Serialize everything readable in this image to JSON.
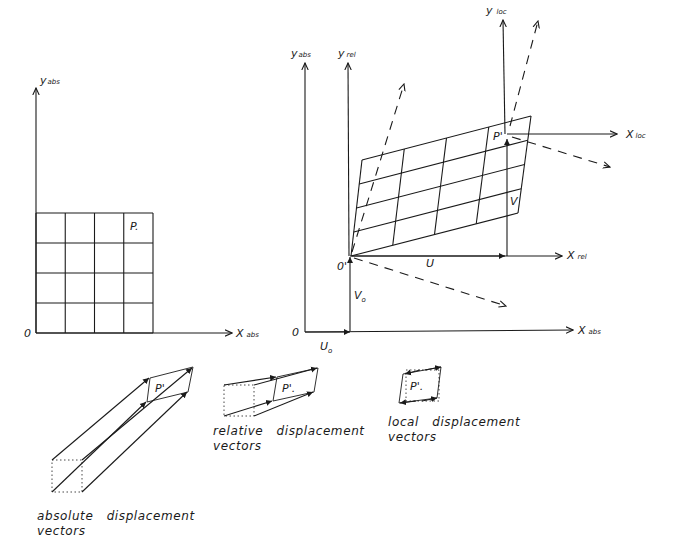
{
  "figure": {
    "left_panel": {
      "origin_label": "0",
      "x_axis_label": "X",
      "x_axis_sub": "abs",
      "y_axis_label": "y",
      "y_axis_sub": "abs",
      "point_label": "P.",
      "grid_rows": 4,
      "grid_cols": 4
    },
    "right_panel": {
      "origin_label": "0",
      "origin_rel_label": "0'",
      "x_abs_label": "X",
      "x_abs_sub": "abs",
      "y_abs_label": "y",
      "y_abs_sub": "abs",
      "x_rel_label": "X",
      "x_rel_sub": "rel",
      "y_rel_label": "y",
      "y_rel_sub": "rel",
      "x_loc_label": "X",
      "x_loc_sub": "loc",
      "y_loc_label": "y",
      "y_loc_sub": "loc",
      "point_label": "P'",
      "u_label": "U",
      "v_label": "V",
      "u0_label": "U",
      "u0_sub": "o",
      "v0_label": "V",
      "v0_sub": "o",
      "grid_rows": 4,
      "grid_cols": 4
    },
    "insets": [
      {
        "id": "absolute",
        "point_label": "P'",
        "caption_line1": "absolute   displacement",
        "caption_line2": "vectors"
      },
      {
        "id": "relative",
        "point_label": "P'.",
        "caption_line1": "relative   displacement",
        "caption_line2": "vectors"
      },
      {
        "id": "local",
        "point_label": "P'.",
        "caption_line1": "local   displacement",
        "caption_line2": "vectors"
      }
    ]
  }
}
